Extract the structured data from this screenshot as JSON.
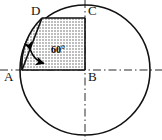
{
  "figure": {
    "type": "geometry-diagram",
    "canvas": {
      "width": 162,
      "height": 140,
      "background": "#ffffff"
    },
    "stroke_color": "#111111",
    "shade_fill": "#d9d9d9",
    "axis_style": "dash-dot",
    "circle": {
      "cx": 85,
      "cy": 70,
      "r": 65
    },
    "points": [
      {
        "name": "A",
        "x": 22,
        "y": 70,
        "label": "A",
        "label_x": 5,
        "label_y": 72
      },
      {
        "name": "B",
        "x": 85,
        "y": 70,
        "label": "B",
        "label_x": 88,
        "label_y": 72
      },
      {
        "name": "C",
        "x": 85,
        "y": 18,
        "label": "C",
        "label_x": 88,
        "label_y": 6
      },
      {
        "name": "D",
        "x": 42,
        "y": 18,
        "label": "D",
        "label_x": 31,
        "label_y": 6
      }
    ],
    "angle": {
      "vertex": "A",
      "value": "60",
      "unit": "°",
      "label": "60°",
      "label_x": 52,
      "label_y": 48
    },
    "edges": [
      {
        "from": "A",
        "to": "B",
        "kind": "solid"
      },
      {
        "from": "B",
        "to": "C",
        "kind": "solid"
      },
      {
        "from": "C",
        "to": "D",
        "kind": "solid"
      },
      {
        "from": "A",
        "to": "D",
        "kind": "solid"
      }
    ],
    "arcs": [
      {
        "name": "arc-A-D",
        "description": "circle arc from A to D bounding the shaded sector",
        "kind": "solid"
      },
      {
        "name": "angle-arc-marker",
        "description": "double-headed arrow arc marking the 60 degree angle at A",
        "kind": "double-arrow"
      }
    ],
    "axes": [
      {
        "name": "horizontal-axis",
        "orientation": "horizontal",
        "y": 70,
        "x1": 0,
        "x2": 162
      },
      {
        "name": "vertical-axis",
        "orientation": "vertical",
        "x": 85,
        "y1": 0,
        "y2": 140
      }
    ]
  }
}
